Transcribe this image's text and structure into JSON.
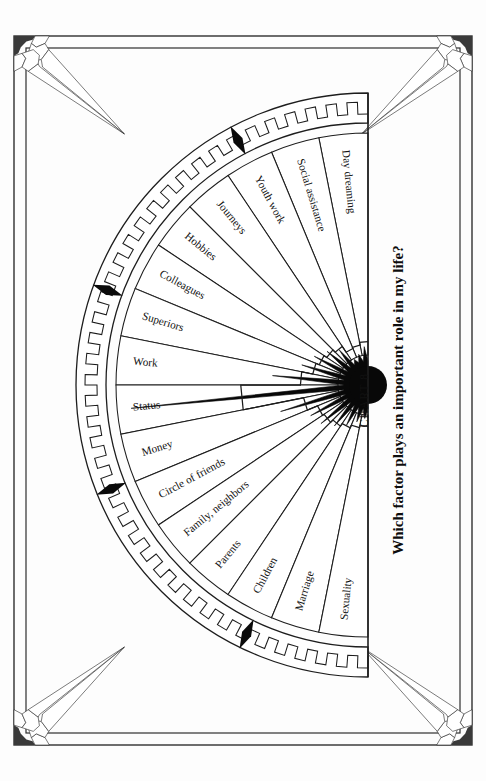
{
  "page": {
    "background_color": "#fdfdfd",
    "ink_color": "#111111"
  },
  "frame": {
    "name": "decorative-border-frame",
    "corner_ornament": "ribbon-corner-ornament",
    "corner_count": 4
  },
  "chart_label": "CHART 8",
  "title": "Which factor plays an important role in my life?",
  "chart_data": {
    "type": "pie",
    "title": "Which factor plays an important role in my life?",
    "subtitle": "CHART 8",
    "xlabel": "",
    "ylabel": "",
    "orientation": "semicircle-fan, opening to the left, centered on right edge",
    "grid": false,
    "legend": "none",
    "categories": [
      "Day dreaming",
      "Social assistance",
      "Youth work",
      "Journeys",
      "Hobbies",
      "Colleagues",
      "Superiors",
      "Work",
      "Status",
      "Money",
      "Circle of friends",
      "Family, neighbors",
      "Parents",
      "Children",
      "Marriage",
      "Sexuality"
    ],
    "values": [
      18,
      14,
      12,
      22,
      26,
      30,
      34,
      46,
      98,
      44,
      32,
      30,
      26,
      22,
      18,
      15
    ],
    "value_unit": "relative importance (radial extent)",
    "ylim": [
      0,
      100
    ],
    "series": [
      {
        "name": "Importance (black radial burst)",
        "values": [
          18,
          14,
          12,
          22,
          26,
          30,
          34,
          46,
          98,
          44,
          32,
          30,
          26,
          22,
          18,
          15
        ]
      }
    ]
  },
  "sectors": [
    {
      "label": "Day dreaming",
      "value": 18
    },
    {
      "label": "Social assistance",
      "value": 14
    },
    {
      "label": "Youth work",
      "value": 12
    },
    {
      "label": "Journeys",
      "value": 22
    },
    {
      "label": "Hobbies",
      "value": 26
    },
    {
      "label": "Colleagues",
      "value": 30
    },
    {
      "label": "Superiors",
      "value": 34
    },
    {
      "label": "Work",
      "value": 46
    },
    {
      "label": "Status",
      "value": 98
    },
    {
      "label": "Money",
      "value": 44
    },
    {
      "label": "Circle of friends",
      "value": 32
    },
    {
      "label": "Family, neighbors",
      "value": 30
    },
    {
      "label": "Parents",
      "value": 26
    },
    {
      "label": "Children",
      "value": 22
    },
    {
      "label": "Marriage",
      "value": 18
    },
    {
      "label": "Sexuality",
      "value": 15
    }
  ],
  "arc_band": {
    "name": "stair-step-arc-band",
    "marker_count": 4,
    "marker_shape": "black-diamond-arrow"
  }
}
